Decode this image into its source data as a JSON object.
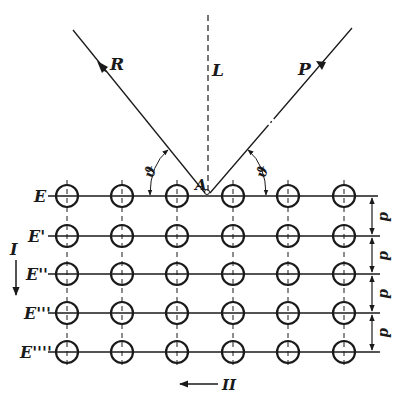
{
  "diagram": {
    "title": "",
    "colors": {
      "ink": "#1a1a1a",
      "background": "#ffffff"
    },
    "rays": {
      "reflected": {
        "label": "R"
      },
      "normal": {
        "label": "L"
      },
      "incident": {
        "label": "P"
      },
      "point": {
        "label": "A"
      }
    },
    "angle_label": "ϑ",
    "planes": [
      {
        "label": "E"
      },
      {
        "label": "E'"
      },
      {
        "label": "E''"
      },
      {
        "label": "E'''"
      },
      {
        "label": "E''''"
      }
    ],
    "spacing_label": "d",
    "direction_labels": {
      "vertical": "I",
      "horizontal": "II"
    },
    "grid": {
      "rows": 5,
      "columns": 6
    }
  }
}
